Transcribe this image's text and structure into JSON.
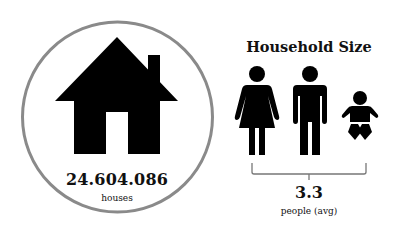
{
  "houses": {
    "count": "24.604.086",
    "label": "houses",
    "icon": "house-icon"
  },
  "household_size": {
    "title": "Household Size",
    "value": "3.3",
    "label": "people (avg)",
    "figures": [
      "woman-icon",
      "man-icon",
      "baby-icon"
    ]
  },
  "colors": {
    "icon": "#000000",
    "ring": "#8a8a8a",
    "text": "#111111",
    "background": "#ffffff"
  }
}
